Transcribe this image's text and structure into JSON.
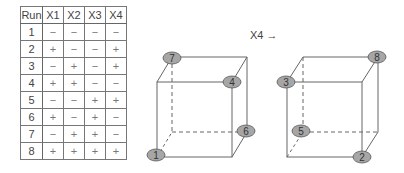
{
  "table": {
    "headers": [
      "Run",
      "X1",
      "X2",
      "X3",
      "X4"
    ],
    "rows": [
      [
        "1",
        "−",
        "−",
        "−",
        "−"
      ],
      [
        "2",
        "+",
        "−",
        "−",
        "+"
      ],
      [
        "3",
        "−",
        "+",
        "−",
        "+"
      ],
      [
        "4",
        "+",
        "+",
        "−",
        "−"
      ],
      [
        "5",
        "−",
        "−",
        "+",
        "+"
      ],
      [
        "6",
        "+",
        "−",
        "+",
        "−"
      ],
      [
        "7",
        "−",
        "+",
        "+",
        "−"
      ],
      [
        "8",
        "+",
        "+",
        "+",
        "+"
      ]
    ]
  },
  "arrow_label": "X4 →",
  "cubes": [
    {
      "name": "cube-x4-low",
      "nodes": [
        {
          "label": "7",
          "position": "back-top-left"
        },
        {
          "label": "4",
          "position": "front-top-right"
        },
        {
          "label": "6",
          "position": "back-bottom-right"
        },
        {
          "label": "1",
          "position": "front-bottom-left"
        }
      ]
    },
    {
      "name": "cube-x4-high",
      "nodes": [
        {
          "label": "3",
          "position": "front-top-left"
        },
        {
          "label": "8",
          "position": "back-top-right"
        },
        {
          "label": "5",
          "position": "back-bottom-left"
        },
        {
          "label": "2",
          "position": "front-bottom-right"
        }
      ]
    }
  ],
  "colors": {
    "node_fill": "#a6a6a6",
    "node_stroke": "#555555",
    "line": "#666666"
  }
}
